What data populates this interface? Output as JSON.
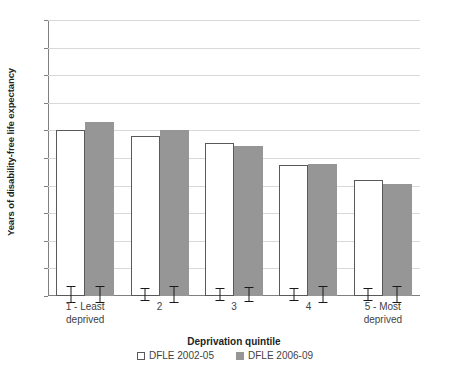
{
  "chart_data": {
    "type": "bar",
    "title": "",
    "xlabel": "Deprivation quintile",
    "ylabel": "Years of disability-free life expectancy",
    "ylim": [
      0,
      20
    ],
    "ytick_step": 2,
    "yticks": [
      "20",
      "18",
      "16",
      "14",
      "12",
      "10",
      "8",
      "6",
      "4",
      "2",
      "0"
    ],
    "grid": true,
    "legend_position": "bottom",
    "categories": [
      "1 - Least deprived",
      "2",
      "3",
      "4",
      "5 - Most deprived"
    ],
    "category_lines": [
      [
        "1 - Least",
        "deprived"
      ],
      [
        "2",
        ""
      ],
      [
        "3",
        ""
      ],
      [
        "4",
        ""
      ],
      [
        "5 - Most",
        "deprived"
      ]
    ],
    "series": [
      {
        "name": "DFLE 2002-05",
        "color": "#ffffff",
        "border": "#595959",
        "values": [
          12.0,
          11.6,
          11.1,
          9.5,
          8.4
        ],
        "err_low": [
          0.55,
          0.45,
          0.45,
          0.45,
          0.45
        ],
        "err_high": [
          0.55,
          0.45,
          0.45,
          0.45,
          0.45
        ]
      },
      {
        "name": "DFLE 2006-09",
        "color": "#969696",
        "border": "#969696",
        "values": [
          12.6,
          12.0,
          10.9,
          9.55,
          8.1
        ],
        "err_low": [
          0.6,
          0.55,
          0.5,
          0.55,
          0.6
        ],
        "err_high": [
          0.6,
          0.55,
          0.5,
          0.55,
          0.6
        ]
      }
    ]
  },
  "legend": {
    "items": [
      {
        "label": "DFLE 2002-05",
        "swatch": "light"
      },
      {
        "label": "DFLE 2006-09",
        "swatch": "dark"
      }
    ]
  }
}
